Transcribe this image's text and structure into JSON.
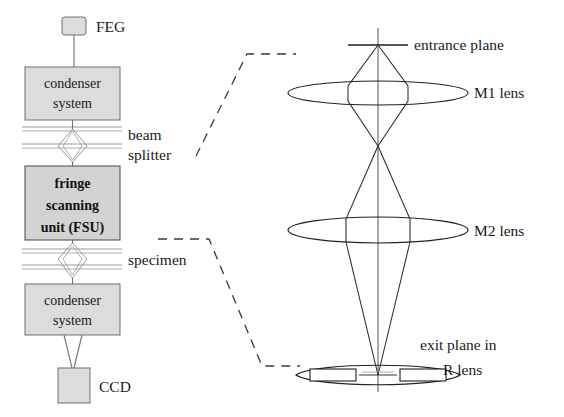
{
  "figure": {
    "background_color": "#ffffff",
    "ink_color": "#1a1a1a",
    "box_fill_color": "#dcdcdc",
    "box_stroke_color": "#6e6e6e"
  },
  "left_column": {
    "name": "microscope-column",
    "source": {
      "label": "FEG",
      "shape": "small-rounded-box"
    },
    "blocks": [
      {
        "id": "condenser-top",
        "lines": [
          "condenser",
          "system"
        ],
        "bold": false
      },
      {
        "id": "fsu",
        "lines": [
          "fringe",
          "scanning",
          "unit (FSU)"
        ],
        "bold": true
      },
      {
        "id": "condenser-bottom",
        "lines": [
          "condenser",
          "system"
        ],
        "bold": false
      }
    ],
    "detector": {
      "label": "CCD",
      "shape": "box"
    },
    "annotations": [
      {
        "id": "beam-splitter",
        "lines": [
          "beam",
          "splitter"
        ]
      },
      {
        "id": "specimen",
        "lines": [
          "specimen"
        ]
      }
    ]
  },
  "right_panel": {
    "name": "ray-optics-schematic",
    "labels": [
      {
        "id": "entrance-plane",
        "text": "entrance plane"
      },
      {
        "id": "m1-lens",
        "text": "M1 lens"
      },
      {
        "id": "m2-lens",
        "text": "M2 lens"
      },
      {
        "id": "exit-plane-line1",
        "text": "exit plane in"
      },
      {
        "id": "exit-plane-line2",
        "text": "R lens"
      }
    ]
  },
  "connectors": [
    {
      "id": "leader-beam-splitter-to-entrance-plane",
      "style": "dashed"
    },
    {
      "id": "leader-specimen-to-exit-plane",
      "style": "dashed"
    }
  ]
}
